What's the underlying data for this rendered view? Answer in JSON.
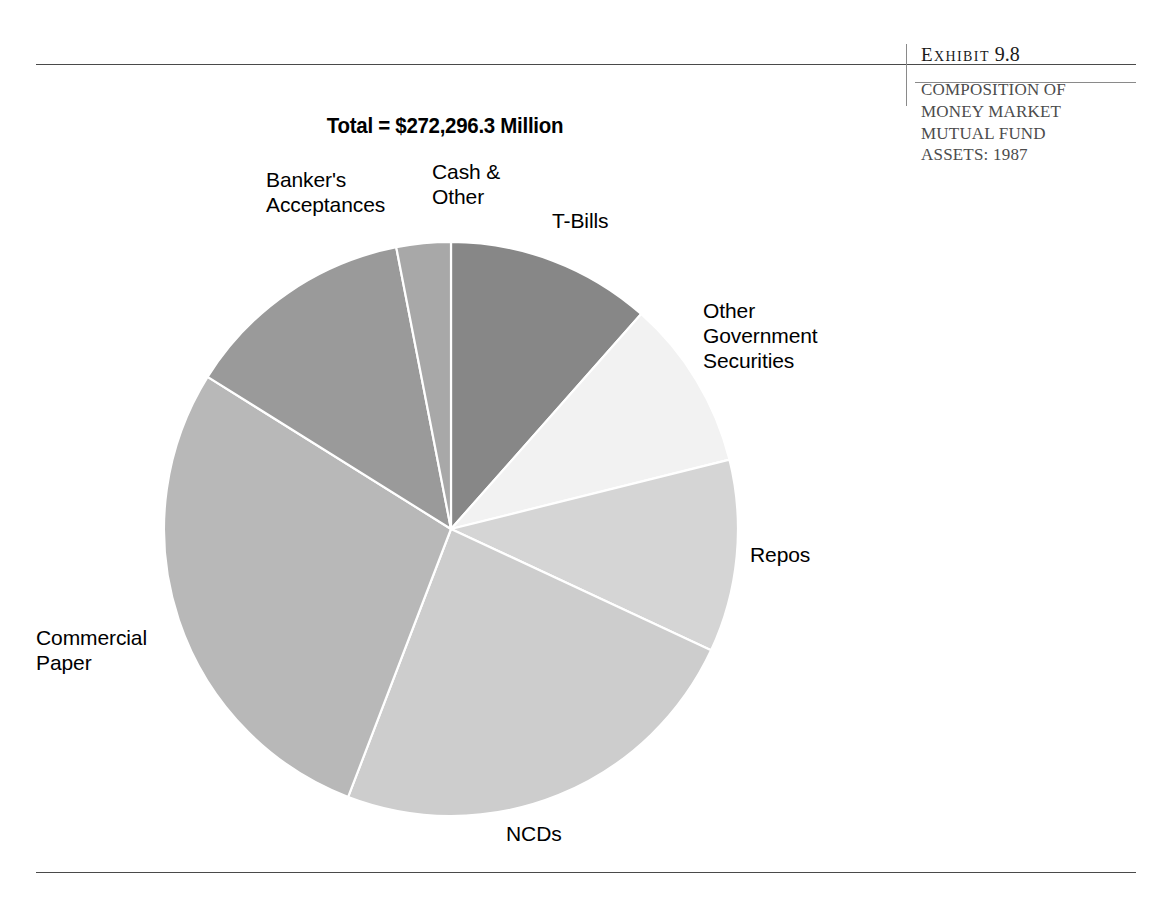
{
  "exhibit": {
    "label_word": "Exhibit",
    "label_first_letter": "E",
    "label_rest": "XHIBIT",
    "number": "9.8",
    "caption_lines": [
      "COMPOSITION OF",
      "MONEY MARKET",
      "MUTUAL FUND",
      "ASSETS: 1987"
    ]
  },
  "chart_data": {
    "type": "pie",
    "title": "Total = $272,296.3 Million",
    "total_label": "Total = $272,296.3 Million",
    "total_value": 272296.3,
    "total_units": "Million",
    "currency": "USD",
    "year": 1987,
    "legend_position": "outside-callout",
    "start_angle_deg": 0,
    "direction": "clockwise",
    "center": {
      "x": 451,
      "y": 529
    },
    "radius": 287,
    "categories": [
      "T-Bills",
      "Other Government Securities",
      "Repos",
      "NCDs",
      "Commercial Paper",
      "Banker's Acceptances",
      "Cash & Other"
    ],
    "values": [
      11.5,
      9.6,
      10.8,
      23.9,
      28.1,
      13.1,
      3.0
    ],
    "value_units": "percent",
    "slices": [
      {
        "label": "T-Bills",
        "label_text": "T-Bills",
        "percent": 11.5,
        "start_deg": 0,
        "end_deg": 41.5,
        "color": "#878787"
      },
      {
        "label": "Other Government Securities",
        "label_text": "Other\nGovernment\nSecurities",
        "percent": 9.6,
        "start_deg": 41.5,
        "end_deg": 76,
        "color": "#f2f2f2"
      },
      {
        "label": "Repos",
        "label_text": "Repos",
        "percent": 10.8,
        "start_deg": 76,
        "end_deg": 115,
        "color": "#d5d5d5"
      },
      {
        "label": "NCDs",
        "label_text": "NCDs",
        "percent": 23.9,
        "start_deg": 115,
        "end_deg": 201,
        "color": "#cdcdcd"
      },
      {
        "label": "Commercial Paper",
        "label_text": "Commercial\nPaper",
        "percent": 28.1,
        "start_deg": 201,
        "end_deg": 302,
        "color": "#b8b8b8"
      },
      {
        "label": "Banker's Acceptances",
        "label_text": "Banker's\nAcceptances",
        "percent": 13.1,
        "start_deg": 302,
        "end_deg": 349,
        "color": "#9a9a9a"
      },
      {
        "label": "Cash & Other",
        "label_text": "Cash &\nOther",
        "percent": 3.0,
        "start_deg": 349,
        "end_deg": 360,
        "color": "#a8a8a8"
      }
    ],
    "slice_separator_color": "#ffffff"
  }
}
